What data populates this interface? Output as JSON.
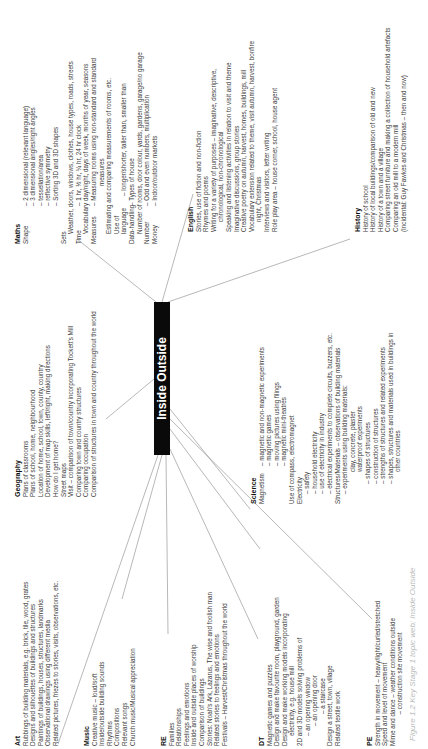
{
  "center_topic": "Inside Outside",
  "caption": "Figure 1.2 Key Stage 1 topic web: Inside Outside",
  "maths": {
    "title": "Maths",
    "shape_label": "Shape",
    "shape_items": [
      "– 2 dimensional (relevant language)",
      "– 3 dimensional angles/right angles",
      "– tessellation/area",
      "– reflective symmetry",
      "– Sorting 3D and 3D shapes"
    ],
    "sets_label": "Sets",
    "sets_text": "Weather, doors, windows, clothes, house types, roads, streets",
    "time_label": "Time",
    "time_items": [
      "– 1 hr, ½ hr, ¼ hr, 24 hr clock",
      "Vocabulary day/night, days of week, months of year, seasons"
    ],
    "measures_label": "Measures",
    "measures_items": [
      "– Measuring rooms using non-standard and standard",
      "measures",
      "Estimating and comparing measurements of rooms, etc."
    ],
    "use_of_language_label": "Use of language",
    "use_of_language_text": "– longer/shorter, taller than, smaller than",
    "data_label": "Data-handling",
    "data_items": [
      "– Types of house",
      "Number of rooms, door colour, yards, gardens, garage/no garage"
    ],
    "number_label": "Number",
    "number_text": "– Odd and even numbers, multiplication",
    "money_label": "Money",
    "money_text": "– Indoor/outdoor markets"
  },
  "english": {
    "title": "English",
    "items": [
      "Stories, use of fiction and non-fiction",
      "Rhymes and poems",
      "Writing for a variety of purposes – imaginative, descriptive,",
      "   chronological, non-chronological",
      "Speaking and listening activities in relation to visit and theme",
      "Imaginative discussions, group stories",
      "Creative poetry on autumn, harvest, homes, buildings, mill",
      "Vocabulary extension related to theme, visit autumn, harvest, bonfire",
      "   night, Christmas",
      "Interviews and visitors, letter writing",
      "Role play area – house corner, school, house agent"
    ]
  },
  "history": {
    "title": "History",
    "items": [
      "History of school",
      "History of local buildings/comparison of old and new",
      "History of a town and a village",
      "Comparing street furniture and making a collection of household artefacts",
      "Comparing an old mill to a modern mill",
      "(Incidental: Guy Fawkes and Christmas – then and now)"
    ]
  },
  "geography": {
    "title": "Geography",
    "items": [
      "Plans of classrooms",
      "Plans of school, home, neighbourhood",
      "Location of home, school, town, county, country",
      "Development of map skills, left/right, making directions",
      "How do I get home?",
      "Street maps",
      "Visit – comparison of town/country incorporating Tockett's Mill",
      "Comparing town and country structures",
      "Comparing occupation",
      "Comparison of structures in town and country throughout the world"
    ]
  },
  "science": {
    "title": "Science",
    "magnetism_label": "Magnetism",
    "magnetism_items": [
      "– magnetic and non-magnetic experiments",
      "– magnetic games",
      "– moving pictures using filings",
      "– magnetic mini-theatres"
    ],
    "compass_text": "Use of compass, electromagnet",
    "electricity_label": "Electricity",
    "electricity_items": [
      "– safety",
      "– household electricity",
      "– use of electricity in industry",
      "– electrical experiments to complete circuits, buzzers, etc."
    ],
    "structures_text": "Structures/Materials – observations of building materials",
    "structures_items": [
      "– experiments using building materials:",
      "clay, concrete, plaster",
      "waterproof experiments",
      "– shapes of structures",
      "– construction of structures",
      "– strengths of structures and related experiments",
      "– shapes, structures and materials used in buildings in",
      "other countries"
    ]
  },
  "art": {
    "title": "Art",
    "items": [
      "Rubbings of building materials, e.g. brick, tile, wood, grates",
      "Designs and silhouettes of buildings and structures",
      "Paintings of buildings, houses, structures, landmarks",
      "Observational drawings using different media",
      "Related pictures, friezes to stories, visits, observations, etc."
    ]
  },
  "music": {
    "title": "Music",
    "items": [
      "Creative music – loud/soft",
      "Inside/outside building sounds",
      "Rhythms",
      "Compositions",
      "Relevant songs",
      "Church music/Musical appreciation"
    ]
  },
  "re": {
    "title": "RE",
    "items": [
      "Families",
      "Relationships",
      "Feelings and emotions",
      "Inside and outside places of worship",
      "Comparison of buildings",
      "Stories: Noah's Ark, Lazarus, The wise and foolish man",
      "Related stories to feelings and emotions",
      "Festivals – Harvest/Christmas throughout the world"
    ]
  },
  "dt": {
    "title": "DT",
    "items": [
      "Magnetic games and puzzles",
      "Design and make favourite room, playground, garden",
      "Design and make working models incorporating",
      "   electricity, e.g. house mill",
      "2D and 3D models solving problems of",
      "   – an opening window",
      "      – an opening door",
      "         – a staircase",
      "Design a street, town, village",
      "Related textile work"
    ]
  },
  "pe": {
    "title": "PE",
    "items": [
      "Strength in movement – heavy/light/curled/stretched",
      "Speed and level of movement",
      "Mime and dance – weather conditions outside",
      "                  – construction site movement"
    ]
  }
}
